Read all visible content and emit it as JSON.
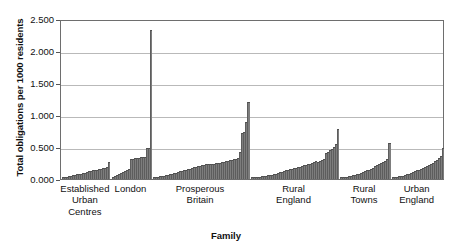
{
  "chart_data": {
    "type": "bar",
    "title": "",
    "xlabel": "Family",
    "ylabel": "Total obligations per 1000 residents",
    "ylim": [
      0,
      2.5
    ],
    "grid": true,
    "legend": false,
    "ytick_labels": [
      "0.000",
      "0.500",
      "1.000",
      "1.500",
      "2.000",
      "2.500"
    ],
    "ytick_values": [
      0,
      0.5,
      1.0,
      1.5,
      2.0,
      2.5
    ],
    "categories": [
      "Established\nUrban\nCentres",
      "London",
      "Prosperous\nBritain",
      "Rural\nEngland",
      "Rural\nTowns",
      "Urban\nEngland"
    ],
    "groups": [
      {
        "name": "Established Urban Centres",
        "values": [
          0.012,
          0.018,
          0.022,
          0.028,
          0.035,
          0.04,
          0.048,
          0.055,
          0.062,
          0.07,
          0.078,
          0.086,
          0.095,
          0.104,
          0.112,
          0.12,
          0.122,
          0.128,
          0.135,
          0.142,
          0.15,
          0.158,
          0.168,
          0.246
        ]
      },
      {
        "name": "London",
        "values": [
          0.02,
          0.034,
          0.046,
          0.06,
          0.074,
          0.09,
          0.105,
          0.122,
          0.14,
          0.29,
          0.3,
          0.305,
          0.31,
          0.318,
          0.322,
          0.325,
          0.33,
          0.465,
          0.475,
          2.31
        ]
      },
      {
        "name": "Prosperous Britain",
        "values": [
          0.01,
          0.015,
          0.02,
          0.026,
          0.032,
          0.038,
          0.045,
          0.052,
          0.06,
          0.068,
          0.076,
          0.085,
          0.094,
          0.103,
          0.112,
          0.122,
          0.13,
          0.14,
          0.148,
          0.156,
          0.165,
          0.172,
          0.18,
          0.188,
          0.196,
          0.204,
          0.212,
          0.218,
          0.225,
          0.215,
          0.222,
          0.23,
          0.236,
          0.242,
          0.25,
          0.256,
          0.262,
          0.268,
          0.275,
          0.282,
          0.29,
          0.3,
          0.31,
          0.405,
          0.7,
          0.715,
          0.88,
          1.19
        ]
      },
      {
        "name": "Rural England",
        "values": [
          0.006,
          0.009,
          0.013,
          0.018,
          0.022,
          0.026,
          0.03,
          0.035,
          0.04,
          0.046,
          0.052,
          0.06,
          0.07,
          0.082,
          0.092,
          0.1,
          0.11,
          0.118,
          0.126,
          0.134,
          0.142,
          0.15,
          0.158,
          0.166,
          0.176,
          0.186,
          0.196,
          0.206,
          0.216,
          0.226,
          0.24,
          0.255,
          0.27,
          0.25,
          0.262,
          0.275,
          0.29,
          0.385,
          0.4,
          0.43,
          0.46,
          0.49,
          0.53,
          0.76
        ]
      },
      {
        "name": "Rural Towns",
        "values": [
          0.008,
          0.012,
          0.016,
          0.02,
          0.026,
          0.032,
          0.04,
          0.048,
          0.058,
          0.068,
          0.08,
          0.092,
          0.104,
          0.118,
          0.132,
          0.148,
          0.164,
          0.18,
          0.196,
          0.212,
          0.23,
          0.25,
          0.268,
          0.29,
          0.545
        ]
      },
      {
        "name": "Urban England",
        "values": [
          0.01,
          0.014,
          0.018,
          0.024,
          0.03,
          0.038,
          0.046,
          0.056,
          0.068,
          0.082,
          0.096,
          0.108,
          0.12,
          0.132,
          0.146,
          0.16,
          0.175,
          0.19,
          0.205,
          0.222,
          0.24,
          0.26,
          0.282,
          0.31,
          0.34,
          0.47
        ]
      }
    ],
    "group_gap_fraction": 0.9,
    "bar_color": "#7d7d7d",
    "axis_color": "#6e6e6e",
    "grid_color": "#b9b9b9"
  }
}
